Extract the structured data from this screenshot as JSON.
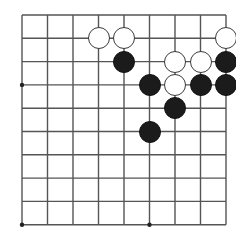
{
  "figure": {
    "kind": "go-board-diagram",
    "name": "Go board position diagram",
    "background_color": "#ffffff"
  },
  "board": {
    "columns": 9,
    "rows": 10,
    "line_color": "#555555",
    "line_width_px": 1.4,
    "origin_x": 22,
    "origin_y": 15,
    "col_spacing": 25.5,
    "row_spacing": 23.3,
    "star_points": [
      {
        "col": 1,
        "row": 4
      },
      {
        "col": 1,
        "row": 10
      },
      {
        "col": 6,
        "row": 10
      }
    ],
    "star_point_color": "#222222",
    "star_point_radius_px": 2.2
  },
  "stones": {
    "radius_px": 11,
    "black_color": "#1b1b1b",
    "white_color": "#ffffff",
    "white_edge_color": "#3a3a3a",
    "items": [
      {
        "color": "white",
        "col": 4,
        "row": 2,
        "label": "white-stone-d2"
      },
      {
        "color": "white",
        "col": 5,
        "row": 2,
        "label": "white-stone-e2"
      },
      {
        "color": "white",
        "col": 9,
        "row": 2,
        "label": "white-stone-i2"
      },
      {
        "color": "black",
        "col": 5,
        "row": 3,
        "label": "black-stone-e3"
      },
      {
        "color": "white",
        "col": 7,
        "row": 3,
        "label": "white-stone-g3"
      },
      {
        "color": "white",
        "col": 8,
        "row": 3,
        "label": "white-stone-h3"
      },
      {
        "color": "black",
        "col": 9,
        "row": 3,
        "label": "black-stone-i3"
      },
      {
        "color": "black",
        "col": 6,
        "row": 4,
        "label": "black-stone-f4"
      },
      {
        "color": "white",
        "col": 7,
        "row": 4,
        "label": "white-stone-g4"
      },
      {
        "color": "black",
        "col": 8,
        "row": 4,
        "label": "black-stone-h4"
      },
      {
        "color": "black",
        "col": 9,
        "row": 4,
        "label": "black-stone-i4"
      },
      {
        "color": "black",
        "col": 7,
        "row": 5,
        "label": "black-stone-g5"
      },
      {
        "color": "black",
        "col": 6,
        "row": 6,
        "label": "black-stone-f6"
      }
    ]
  }
}
